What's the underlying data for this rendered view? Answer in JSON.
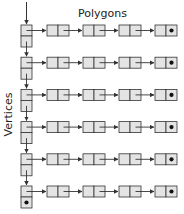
{
  "diagram": {
    "title": "Polygons",
    "side_label": "Vertices",
    "colors": {
      "box_fill": "#e4e4e4",
      "stroke": "#333333",
      "null_dot": "#111111"
    },
    "rows": [
      {
        "index": 0,
        "polygon_nodes": 4,
        "vertex_null": false
      },
      {
        "index": 1,
        "polygon_nodes": 4,
        "vertex_null": false
      },
      {
        "index": 2,
        "polygon_nodes": 4,
        "vertex_null": false
      },
      {
        "index": 3,
        "polygon_nodes": 4,
        "vertex_null": false
      },
      {
        "index": 4,
        "polygon_nodes": 4,
        "vertex_null": false
      },
      {
        "index": 5,
        "polygon_nodes": 4,
        "vertex_null": true
      }
    ]
  }
}
